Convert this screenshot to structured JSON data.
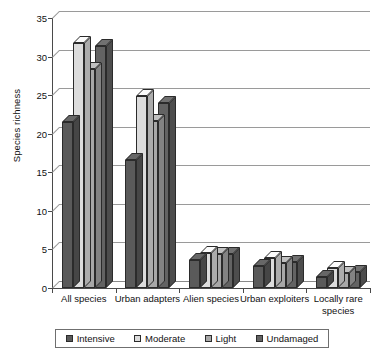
{
  "chart_data": {
    "type": "bar",
    "title": "",
    "xlabel": "",
    "ylabel": "Species richness",
    "ylim": [
      0,
      35
    ],
    "yticks": [
      0,
      5,
      10,
      15,
      20,
      25,
      30,
      35
    ],
    "grid": true,
    "legend_position": "bottom",
    "categories": [
      "All species",
      "Urban adapters",
      "Alien species",
      "Urban exploiters",
      "Locally rare species"
    ],
    "series": [
      {
        "name": "Intensive",
        "color": "#5a5a5a",
        "values": [
          21.5,
          16.6,
          3.6,
          2.9,
          1.4
        ]
      },
      {
        "name": "Moderate",
        "color": "#dcdcdc",
        "values": [
          31.8,
          24.9,
          4.6,
          3.9,
          2.6
        ]
      },
      {
        "name": "Light",
        "color": "#a8a8a8",
        "values": [
          28.4,
          21.6,
          4.4,
          3.3,
          1.9
        ]
      },
      {
        "name": "Undamaged",
        "color": "#636363",
        "values": [
          31.4,
          24.0,
          4.4,
          3.4,
          2.1
        ]
      }
    ]
  },
  "legend": {
    "items": [
      {
        "label": "Intensive"
      },
      {
        "label": "Moderate"
      },
      {
        "label": "Light"
      },
      {
        "label": "Undamaged"
      }
    ]
  }
}
